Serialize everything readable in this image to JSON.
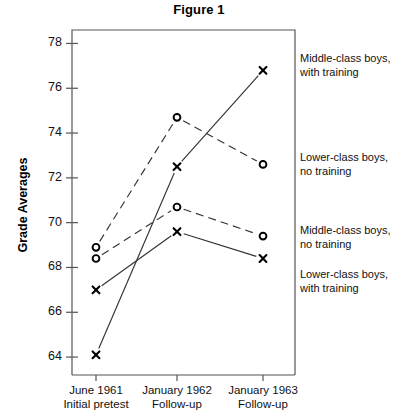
{
  "title": "Figure 1",
  "axis": {
    "ylabel": "Grade Averages",
    "yticks": [
      64,
      66,
      68,
      70,
      72,
      74,
      76,
      78
    ],
    "xticks": [
      {
        "line1": "June 1961",
        "line2": "Initial pretest"
      },
      {
        "line1": "January 1962",
        "line2": "Follow-up"
      },
      {
        "line1": "January 1963",
        "line2": "Follow-up"
      }
    ]
  },
  "legend": [
    {
      "label_line1": "Middle-class boys,",
      "label_line2": "with training"
    },
    {
      "label_line1": "Lower-class boys,",
      "label_line2": "no training"
    },
    {
      "label_line1": "Middle-class boys,",
      "label_line2": "no training"
    },
    {
      "label_line1": "Lower-class boys,",
      "label_line2": "with training"
    }
  ],
  "chart_data": {
    "type": "line",
    "title": "Figure 1",
    "xlabel": "",
    "ylabel": "Grade Averages",
    "ylim": [
      63.2,
      78.6
    ],
    "grid": false,
    "legend_position": "right",
    "categories": [
      "June 1961 Initial pretest",
      "January 1962 Follow-up",
      "January 1963 Follow-up"
    ],
    "series": [
      {
        "name": "Middle-class boys, with training",
        "marker": "x",
        "linestyle": "solid",
        "color": "#333333",
        "values": [
          64.1,
          72.5,
          76.8
        ]
      },
      {
        "name": "Lower-class boys, no training",
        "marker": "o",
        "linestyle": "dashed",
        "color": "#333333",
        "values": [
          68.9,
          74.7,
          72.6
        ]
      },
      {
        "name": "Middle-class boys, no training",
        "marker": "o",
        "linestyle": "dashed",
        "color": "#333333",
        "values": [
          68.4,
          70.7,
          69.4
        ]
      },
      {
        "name": "Lower-class boys, with training",
        "marker": "x",
        "linestyle": "solid",
        "color": "#333333",
        "values": [
          67.0,
          69.6,
          68.4
        ]
      }
    ]
  }
}
